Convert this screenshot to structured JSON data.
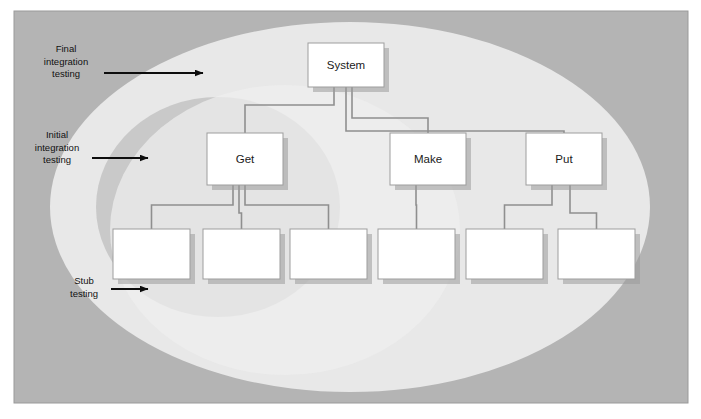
{
  "figure": {
    "type": "software-testing-strategy-diagram",
    "frame": {
      "x": 14,
      "y": 11,
      "width": 674,
      "height": 392,
      "fill": "#b4b4b4",
      "border": "#9a9a9a"
    },
    "background": "#ffffff"
  },
  "regions": [
    {
      "id": "final-integration-region",
      "label": "Final integration testing",
      "shape": "ellipse",
      "cx": 350,
      "cy": 207,
      "rx": 300,
      "ry": 185,
      "fill": "#e8e8e8"
    },
    {
      "id": "initial-integration-region",
      "label": "Initial integration testing",
      "shape": "ellipse",
      "cx": 218,
      "cy": 207,
      "rx": 122,
      "ry": 110,
      "fill": "#c9c9c9"
    },
    {
      "id": "stub-testing-region",
      "label": "Stub testing",
      "shape": "ellipse",
      "cx": 285,
      "cy": 230,
      "rx": 175,
      "ry": 145,
      "fill": "#eeeeee"
    }
  ],
  "annotations": [
    {
      "id": "final-integration-annotation",
      "lines": [
        "Final",
        "integration",
        "testing"
      ],
      "text_x": 66,
      "text_y": 52,
      "arrow": {
        "x1": 104,
        "y1": 73,
        "x2": 203,
        "y2": 73
      }
    },
    {
      "id": "initial-integration-annotation",
      "lines": [
        "Initial",
        "integration",
        "testing"
      ],
      "text_x": 57,
      "text_y": 138,
      "arrow": {
        "x1": 92,
        "y1": 158,
        "x2": 148,
        "y2": 158
      }
    },
    {
      "id": "stub-testing-annotation",
      "lines": [
        "Stub",
        "testing"
      ],
      "text_x": 84,
      "text_y": 284,
      "arrow": {
        "x1": 111,
        "y1": 289,
        "x2": 148,
        "y2": 289
      }
    }
  ],
  "tree": {
    "box_style": {
      "fill": "#ffffff",
      "stroke": "#9d9d9d",
      "shadow": "#9b9b9b"
    },
    "connector_color": "#8f8f8f",
    "nodes": [
      {
        "id": "system",
        "label": "System",
        "x": 308,
        "y": 43,
        "width": 76,
        "height": 44,
        "level": 0
      },
      {
        "id": "get",
        "label": "Get",
        "x": 207,
        "y": 133,
        "width": 76,
        "height": 52,
        "level": 1
      },
      {
        "id": "make",
        "label": "Make",
        "x": 390,
        "y": 133,
        "width": 76,
        "height": 52,
        "level": 1
      },
      {
        "id": "put",
        "label": "Put",
        "x": 526,
        "y": 133,
        "width": 76,
        "height": 52,
        "level": 1
      },
      {
        "id": "leaf-1",
        "label": "",
        "x": 113,
        "y": 229,
        "width": 77,
        "height": 50,
        "level": 2
      },
      {
        "id": "leaf-2",
        "label": "",
        "x": 203,
        "y": 229,
        "width": 77,
        "height": 50,
        "level": 2
      },
      {
        "id": "leaf-3",
        "label": "",
        "x": 290,
        "y": 229,
        "width": 77,
        "height": 50,
        "level": 2
      },
      {
        "id": "leaf-4",
        "label": "",
        "x": 378,
        "y": 229,
        "width": 77,
        "height": 50,
        "level": 2
      },
      {
        "id": "leaf-5",
        "label": "",
        "x": 466,
        "y": 229,
        "width": 77,
        "height": 50,
        "level": 2
      },
      {
        "id": "leaf-6",
        "label": "",
        "x": 558,
        "y": 229,
        "width": 77,
        "height": 50,
        "level": 2
      }
    ],
    "edges": [
      {
        "from": "system",
        "to": "get"
      },
      {
        "from": "system",
        "to": "make"
      },
      {
        "from": "system",
        "to": "put"
      },
      {
        "from": "get",
        "to": "leaf-1"
      },
      {
        "from": "get",
        "to": "leaf-2"
      },
      {
        "from": "get",
        "to": "leaf-3"
      },
      {
        "from": "make",
        "to": "leaf-4"
      },
      {
        "from": "put",
        "to": "leaf-5"
      },
      {
        "from": "put",
        "to": "leaf-6"
      }
    ]
  }
}
